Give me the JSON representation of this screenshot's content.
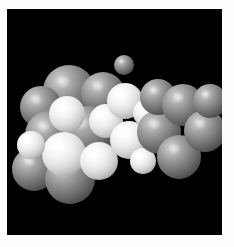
{
  "figure": {
    "background_color": "#000000",
    "border_color": "#ffffff",
    "canvas": {
      "x": 7,
      "y": 9,
      "width": 215,
      "height": 226
    }
  },
  "model": {
    "representation": "space-filling CPK",
    "lighting": "single light source upper-left, specular highlight",
    "palette": {
      "carbon_gray": "#8a8a8a",
      "hydrogen_white": "#f2f2f2",
      "rim_shadow": "#1f1f1f"
    },
    "atoms": [
      {
        "id": 1,
        "element": "C",
        "color": "#8a8a8a",
        "cx": 62,
        "cy": 82,
        "r": 26
      },
      {
        "id": 2,
        "element": "C",
        "color": "#8a8a8a",
        "cx": 34,
        "cy": 98,
        "r": 21
      },
      {
        "id": 3,
        "element": "C",
        "color": "#8a8a8a",
        "cx": 96,
        "cy": 85,
        "r": 22
      },
      {
        "id": 4,
        "element": "C",
        "color": "#8a8a8a",
        "cx": 42,
        "cy": 126,
        "r": 24
      },
      {
        "id": 5,
        "element": "C",
        "color": "#8a8a8a",
        "cx": 81,
        "cy": 123,
        "r": 26
      },
      {
        "id": 6,
        "element": "C",
        "color": "#8a8a8a",
        "cx": 27,
        "cy": 160,
        "r": 22
      },
      {
        "id": 7,
        "element": "C",
        "color": "#8a8a8a",
        "cx": 63,
        "cy": 170,
        "r": 25
      },
      {
        "id": 8,
        "element": "H",
        "color": "#f2f2f2",
        "cx": 60,
        "cy": 105,
        "r": 18
      },
      {
        "id": 9,
        "element": "H",
        "color": "#f2f2f2",
        "cx": 57,
        "cy": 145,
        "r": 22
      },
      {
        "id": 10,
        "element": "H",
        "color": "#f2f2f2",
        "cx": 24,
        "cy": 136,
        "r": 14
      },
      {
        "id": 11,
        "element": "H",
        "color": "#f2f2f2",
        "cx": 92,
        "cy": 152,
        "r": 19
      },
      {
        "id": 12,
        "element": "H",
        "color": "#f2f2f2",
        "cx": 99,
        "cy": 112,
        "r": 17
      },
      {
        "id": 13,
        "element": "H",
        "color": "#f2f2f2",
        "cx": 118,
        "cy": 92,
        "r": 18
      },
      {
        "id": 14,
        "element": "H",
        "color": "#f2f2f2",
        "cx": 122,
        "cy": 131,
        "r": 19
      },
      {
        "id": 15,
        "element": "H",
        "color": "#f2f2f2",
        "cx": 140,
        "cy": 104,
        "r": 14
      },
      {
        "id": 16,
        "element": "H",
        "color": "#f2f2f2",
        "cx": 136,
        "cy": 152,
        "r": 13
      },
      {
        "id": 17,
        "element": "C",
        "color": "#8a8a8a",
        "cx": 152,
        "cy": 123,
        "r": 22
      },
      {
        "id": 18,
        "element": "C",
        "color": "#8a8a8a",
        "cx": 151,
        "cy": 88,
        "r": 18
      },
      {
        "id": 19,
        "element": "C",
        "color": "#8a8a8a",
        "cx": 176,
        "cy": 96,
        "r": 21
      },
      {
        "id": 20,
        "element": "C",
        "color": "#8a8a8a",
        "cx": 172,
        "cy": 148,
        "r": 22
      },
      {
        "id": 21,
        "element": "C",
        "color": "#8a8a8a",
        "cx": 198,
        "cy": 122,
        "r": 21
      },
      {
        "id": 22,
        "element": "C",
        "color": "#8a8a8a",
        "cx": 203,
        "cy": 92,
        "r": 17
      },
      {
        "id": 23,
        "element": "C",
        "color": "#8a8a8a",
        "cx": 117,
        "cy": 56,
        "r": 10
      }
    ]
  }
}
